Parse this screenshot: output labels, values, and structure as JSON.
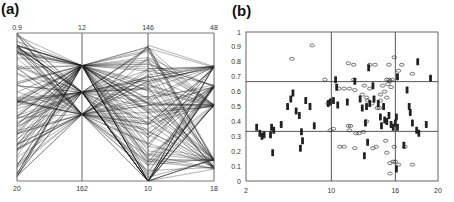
{
  "chart_data": [
    {
      "panel": "(a)",
      "type": "parallel_coordinates",
      "axes": [
        {
          "top_label": "0.9",
          "bottom_label": "20"
        },
        {
          "top_label": "12",
          "bottom_label": "162"
        },
        {
          "top_label": "146",
          "bottom_label": "10"
        },
        {
          "top_label": "48",
          "bottom_label": "18"
        }
      ],
      "axis_levels_normalized": {
        "axis2": [
          0.22,
          0.4,
          0.55
        ],
        "axis4": [
          0.23,
          0.36,
          0.49,
          0.86,
          0.91
        ]
      },
      "line_count": 120,
      "grid": false
    },
    {
      "panel": "(b)",
      "type": "scatter",
      "xlim": [
        2,
        20
      ],
      "ylim": [
        0,
        1
      ],
      "x_ticks": [
        "2",
        "10",
        "16",
        "20"
      ],
      "y_ticks": [
        "0",
        "0.1",
        "0.2",
        "0.3",
        "0.4",
        "0.5",
        "0.6",
        "0.7",
        "0.8",
        "0.9",
        "1"
      ],
      "reference_lines": {
        "x": [
          10,
          16
        ],
        "y": [
          0.333,
          0.667
        ]
      },
      "series": [
        {
          "name": "open-circles",
          "marker": "open-ellipse",
          "points": [
            [
              8.2,
              0.91
            ],
            [
              6.3,
              0.82
            ],
            [
              11.6,
              0.79
            ],
            [
              12.1,
              0.78
            ],
            [
              13.6,
              0.78
            ],
            [
              14.1,
              0.78
            ],
            [
              15.4,
              0.78
            ],
            [
              15.9,
              0.83
            ],
            [
              16.6,
              0.78
            ],
            [
              16.3,
              0.74
            ],
            [
              17.6,
              0.72
            ],
            [
              9.4,
              0.68
            ],
            [
              12.1,
              0.68
            ],
            [
              15.2,
              0.68
            ],
            [
              15.4,
              0.68
            ],
            [
              15.7,
              0.68
            ],
            [
              15.5,
              0.67
            ],
            [
              10.7,
              0.62
            ],
            [
              11.2,
              0.62
            ],
            [
              11.7,
              0.62
            ],
            [
              12.2,
              0.61
            ],
            [
              13.1,
              0.64
            ],
            [
              13.6,
              0.62
            ],
            [
              14.8,
              0.64
            ],
            [
              15.3,
              0.65
            ],
            [
              15.6,
              0.63
            ],
            [
              12.9,
              0.58
            ],
            [
              13.3,
              0.56
            ],
            [
              14.6,
              0.58
            ],
            [
              15.0,
              0.6
            ],
            [
              15.2,
              0.56
            ],
            [
              13.4,
              0.54
            ],
            [
              13.8,
              0.52
            ],
            [
              14.6,
              0.54
            ],
            [
              9.7,
              0.52
            ],
            [
              14.3,
              0.49
            ],
            [
              14.5,
              0.49
            ],
            [
              11.6,
              0.37
            ],
            [
              11.8,
              0.37
            ],
            [
              13.3,
              0.4
            ],
            [
              9.9,
              0.34
            ],
            [
              10.2,
              0.35
            ],
            [
              11.7,
              0.34
            ],
            [
              12.3,
              0.32
            ],
            [
              12.6,
              0.32
            ],
            [
              13.0,
              0.33
            ],
            [
              15.1,
              0.27
            ],
            [
              10.8,
              0.23
            ],
            [
              11.2,
              0.23
            ],
            [
              12.2,
              0.22
            ],
            [
              13.9,
              0.22
            ],
            [
              14.2,
              0.23
            ],
            [
              15.2,
              0.19
            ],
            [
              15.9,
              0.23
            ],
            [
              16.9,
              0.23
            ],
            [
              15.5,
              0.12
            ],
            [
              15.8,
              0.13
            ],
            [
              16.0,
              0.13
            ],
            [
              16.3,
              0.11
            ],
            [
              17.6,
              0.11
            ],
            [
              15.5,
              0.05
            ]
          ]
        },
        {
          "name": "filled-diamonds",
          "marker": "filled-diamond",
          "points": [
            [
              3.0,
              0.36
            ],
            [
              3.3,
              0.32
            ],
            [
              3.5,
              0.3
            ],
            [
              3.7,
              0.31
            ],
            [
              4.3,
              0.31
            ],
            [
              4.4,
              0.36
            ],
            [
              4.6,
              0.34
            ],
            [
              4.5,
              0.19
            ],
            [
              5.3,
              0.38
            ],
            [
              5.9,
              0.5
            ],
            [
              6.2,
              0.55
            ],
            [
              6.4,
              0.59
            ],
            [
              6.7,
              0.47
            ],
            [
              7.0,
              0.44
            ],
            [
              7.2,
              0.33
            ],
            [
              7.3,
              0.27
            ],
            [
              7.1,
              0.22
            ],
            [
              7.6,
              0.54
            ],
            [
              8.0,
              0.5
            ],
            [
              8.4,
              0.37
            ],
            [
              9.7,
              0.52
            ],
            [
              9.9,
              0.53
            ],
            [
              10.2,
              0.54
            ],
            [
              10.4,
              0.68
            ],
            [
              10.5,
              0.63
            ],
            [
              10.6,
              0.51
            ],
            [
              11.5,
              0.53
            ],
            [
              12.2,
              0.67
            ],
            [
              12.7,
              0.55
            ],
            [
              12.9,
              0.49
            ],
            [
              13.3,
              0.5
            ],
            [
              13.5,
              0.76
            ],
            [
              13.2,
              0.39
            ],
            [
              13.6,
              0.52
            ],
            [
              13.9,
              0.64
            ],
            [
              14.0,
              0.55
            ],
            [
              14.4,
              0.52
            ],
            [
              14.6,
              0.43
            ],
            [
              14.7,
              0.37
            ],
            [
              14.9,
              0.5
            ],
            [
              15.0,
              0.41
            ],
            [
              15.2,
              0.4
            ],
            [
              15.4,
              0.44
            ],
            [
              15.6,
              0.38
            ],
            [
              15.8,
              0.36
            ],
            [
              16.0,
              0.39
            ],
            [
              16.1,
              0.43
            ],
            [
              16.1,
              0.08
            ],
            [
              16.2,
              0.7
            ],
            [
              16.2,
              0.36
            ],
            [
              17.1,
              0.61
            ],
            [
              17.3,
              0.5
            ],
            [
              17.4,
              0.46
            ],
            [
              17.6,
              0.39
            ],
            [
              18.0,
              0.34
            ],
            [
              18.2,
              0.32
            ],
            [
              18.9,
              0.38
            ],
            [
              13.4,
              0.26
            ],
            [
              13.1,
              0.17
            ],
            [
              16.8,
              0.24
            ],
            [
              18.1,
              0.8
            ],
            [
              19.3,
              0.69
            ]
          ]
        }
      ]
    }
  ],
  "labels": {
    "panel_a": "(a)",
    "panel_b": "(b)"
  },
  "colors": {
    "line": "#1a1a1a",
    "axis": "#555555",
    "marker": "#222222"
  }
}
